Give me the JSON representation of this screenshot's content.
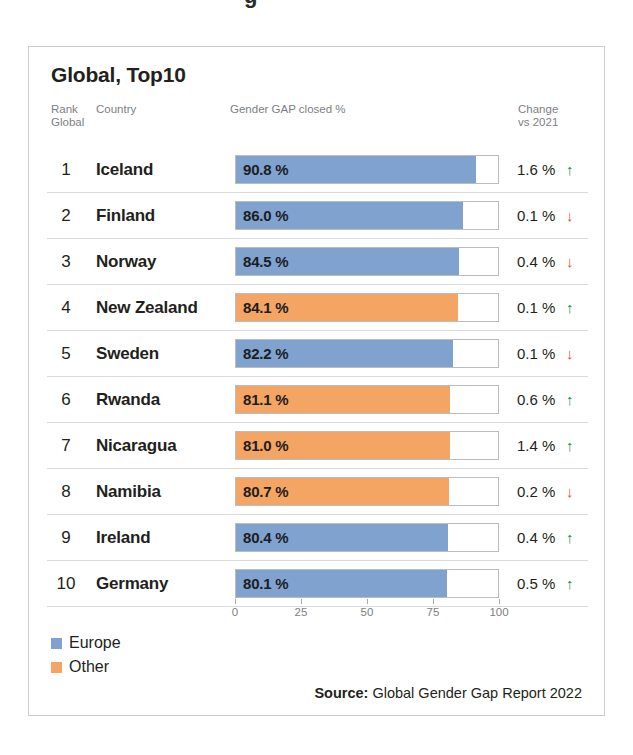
{
  "card": {
    "title": "Global, Top10",
    "headers": {
      "rank": "Rank\nGlobal",
      "country": "Country",
      "bar": "Gender GAP closed %",
      "change": "Change\nvs 2021"
    }
  },
  "legend": {
    "items": [
      {
        "label": "Europe",
        "color": "#7fa2cf",
        "key": "europe"
      },
      {
        "label": "Other",
        "color": "#f4a463",
        "key": "other"
      }
    ]
  },
  "source": {
    "prefix": "Source:",
    "text": "Global Gender Gap Report 2022"
  },
  "colors": {
    "europe": "#7fa2cf",
    "other": "#f4a463",
    "up": "#1e8a4c",
    "down": "#e8502a",
    "border": "#c9ccd1",
    "rule": "#d8dadd"
  },
  "chart_data": {
    "type": "bar",
    "title": "Global, Top10",
    "xlabel": "Gender GAP closed %",
    "ylabel": "",
    "xlim": [
      0,
      100
    ],
    "ticks": [
      0,
      25,
      50,
      75,
      100
    ],
    "tick_labels": [
      "0",
      "25",
      "50",
      "75",
      "100"
    ],
    "grid": false,
    "legend_position": "bottom-left",
    "orientation": "horizontal",
    "categories": [
      "Iceland",
      "Finland",
      "Norway",
      "New Zealand",
      "Sweden",
      "Rwanda",
      "Nicaragua",
      "Namibia",
      "Ireland",
      "Germany"
    ],
    "values": [
      90.8,
      86.0,
      84.5,
      84.1,
      82.2,
      81.1,
      81.0,
      80.7,
      80.4,
      80.1
    ],
    "series": [
      {
        "name": "Europe",
        "color": "#7fa2cf"
      },
      {
        "name": "Other",
        "color": "#f4a463"
      }
    ],
    "rows": [
      {
        "rank": "1",
        "country": "Iceland",
        "value": 90.8,
        "value_label": "90.8 %",
        "group": "europe",
        "change": "1.6 %",
        "direction": "up",
        "arrow": "↑"
      },
      {
        "rank": "2",
        "country": "Finland",
        "value": 86.0,
        "value_label": "86.0 %",
        "group": "europe",
        "change": "0.1 %",
        "direction": "down",
        "arrow": "↓"
      },
      {
        "rank": "3",
        "country": "Norway",
        "value": 84.5,
        "value_label": "84.5 %",
        "group": "europe",
        "change": "0.4 %",
        "direction": "down",
        "arrow": "↓"
      },
      {
        "rank": "4",
        "country": "New Zealand",
        "value": 84.1,
        "value_label": "84.1 %",
        "group": "other",
        "change": "0.1 %",
        "direction": "up",
        "arrow": "↑"
      },
      {
        "rank": "5",
        "country": "Sweden",
        "value": 82.2,
        "value_label": "82.2 %",
        "group": "europe",
        "change": "0.1 %",
        "direction": "down",
        "arrow": "↓"
      },
      {
        "rank": "6",
        "country": "Rwanda",
        "value": 81.1,
        "value_label": "81.1 %",
        "group": "other",
        "change": "0.6 %",
        "direction": "up",
        "arrow": "↑"
      },
      {
        "rank": "7",
        "country": "Nicaragua",
        "value": 81.0,
        "value_label": "81.0 %",
        "group": "other",
        "change": "1.4 %",
        "direction": "up",
        "arrow": "↑"
      },
      {
        "rank": "8",
        "country": "Namibia",
        "value": 80.7,
        "value_label": "80.7 %",
        "group": "other",
        "change": "0.2 %",
        "direction": "down",
        "arrow": "↓"
      },
      {
        "rank": "9",
        "country": "Ireland",
        "value": 80.4,
        "value_label": "80.4 %",
        "group": "europe",
        "change": "0.4 %",
        "direction": "up",
        "arrow": "↑"
      },
      {
        "rank": "10",
        "country": "Germany",
        "value": 80.1,
        "value_label": "80.1 %",
        "group": "europe",
        "change": "0.5 %",
        "direction": "up",
        "arrow": "↑"
      }
    ]
  }
}
